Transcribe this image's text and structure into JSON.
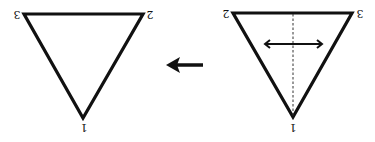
{
  "diagram": {
    "left_triangle": {
      "vertices": [
        {
          "label": "3",
          "x": 24,
          "y": 14,
          "label_x": 17,
          "label_y": 14
        },
        {
          "label": "2",
          "x": 143,
          "y": 14,
          "label_x": 150,
          "label_y": 14
        },
        {
          "label": "1",
          "x": 83,
          "y": 118,
          "label_x": 84,
          "label_y": 127
        }
      ]
    },
    "right_triangle": {
      "vertices": [
        {
          "label": "2",
          "x": 233,
          "y": 13,
          "label_x": 226,
          "label_y": 13
        },
        {
          "label": "3",
          "x": 352,
          "y": 13,
          "label_x": 360,
          "label_y": 13
        },
        {
          "label": "1",
          "x": 293,
          "y": 117,
          "label_x": 293,
          "label_y": 127
        }
      ],
      "axis_of_symmetry": {
        "style": "dashed",
        "x": 293,
        "y1": 13,
        "y2": 117
      },
      "reflection_arrow": {
        "type": "double-headed",
        "y": 44,
        "x1": 263,
        "x2": 324
      }
    },
    "transform_arrow": {
      "direction": "left",
      "y": 65,
      "x_tail": 203,
      "x_head": 166
    },
    "colors": {
      "stroke": "#111111",
      "background": "#ffffff"
    }
  }
}
